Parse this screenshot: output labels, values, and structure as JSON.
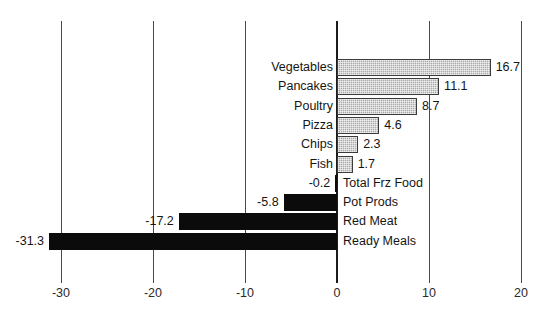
{
  "chart_data": {
    "type": "bar",
    "orientation": "horizontal",
    "title": "",
    "subtitle": "",
    "xlabel": "",
    "ylabel": "",
    "xlim": [
      -35,
      20
    ],
    "axis_tick_labels": [
      "-30",
      "-20",
      "-10",
      "0",
      "10",
      "20"
    ],
    "axis_tick_values": [
      -30,
      -20,
      -10,
      0,
      10,
      20
    ],
    "grid": true,
    "legend": "none",
    "categories": [
      "Vegetables",
      "Pancakes",
      "Poultry",
      "Pizza",
      "Chips",
      "Fish",
      "Total Frz Food",
      "Pot Prods",
      "Red Meat",
      "Ready Meals"
    ],
    "values": [
      16.7,
      11.1,
      8.7,
      4.6,
      2.3,
      1.7,
      -0.2,
      -5.8,
      -17.2,
      -31.3
    ],
    "value_labels": [
      "16.7",
      "11.1",
      "8.7",
      "4.6",
      "2.3",
      "1.7",
      "-0.2",
      "-5.8",
      "-17.2",
      "-31.3"
    ],
    "series": [
      {
        "name": "change",
        "values": [
          16.7,
          11.1,
          8.7,
          4.6,
          2.3,
          1.7,
          -0.2,
          -5.8,
          -17.2,
          -31.3
        ]
      }
    ],
    "colors": {
      "positive_bar": "#a8a8a8",
      "negative_bar": "#0b0b0b",
      "bar_outline": "#3b3b3b",
      "gridline": "#4a4a4a",
      "zero_line": "#1c1c1c",
      "background": "#ffffff",
      "text": "#151515"
    }
  },
  "rows": [
    {
      "label": "Vegetables",
      "value": 16.7,
      "value_text": "16.7",
      "sign": "positive"
    },
    {
      "label": "Pancakes",
      "value": 11.1,
      "value_text": "11.1",
      "sign": "positive"
    },
    {
      "label": "Poultry",
      "value": 8.7,
      "value_text": "8.7",
      "sign": "positive"
    },
    {
      "label": "Pizza",
      "value": 4.6,
      "value_text": "4.6",
      "sign": "positive"
    },
    {
      "label": "Chips",
      "value": 2.3,
      "value_text": "2.3",
      "sign": "positive"
    },
    {
      "label": "Fish",
      "value": 1.7,
      "value_text": "1.7",
      "sign": "positive"
    },
    {
      "label": "Total Frz Food",
      "value": -0.2,
      "value_text": "-0.2",
      "sign": "negative"
    },
    {
      "label": "Pot Prods",
      "value": -5.8,
      "value_text": "-5.8",
      "sign": "negative"
    },
    {
      "label": "Red Meat",
      "value": -17.2,
      "value_text": "-17.2",
      "sign": "negative"
    },
    {
      "label": "Ready Meals",
      "value": -31.3,
      "value_text": "-31.3",
      "sign": "negative"
    }
  ],
  "axis": {
    "ticks": [
      {
        "label": "-30",
        "value": -30
      },
      {
        "label": "-20",
        "value": -20
      },
      {
        "label": "-10",
        "value": -10
      },
      {
        "label": "0",
        "value": 0
      },
      {
        "label": "10",
        "value": 10
      },
      {
        "label": "20",
        "value": 20
      }
    ]
  }
}
